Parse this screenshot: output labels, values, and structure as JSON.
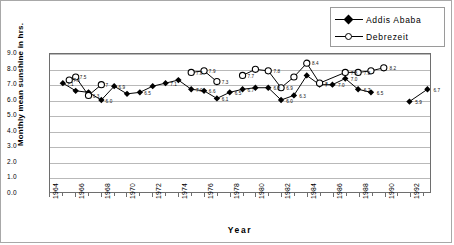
{
  "chart_data": {
    "type": "line",
    "title": "",
    "xlabel": "Year",
    "ylabel": "Monthly mean sunshine in hrs.",
    "xlim": [
      1964,
      1993.6
    ],
    "ylim": [
      0.0,
      9.0
    ],
    "ytick_step": 1.0,
    "grid": true,
    "legend_position": "top-right",
    "ytick_labels": [
      "9.0",
      "8.0",
      "7.0",
      "6.0",
      "5.0",
      "4.0",
      "3.0",
      "2.0",
      "1.0",
      "0.0"
    ],
    "ytick_values": [
      9.0,
      8.0,
      7.0,
      6.0,
      5.0,
      4.0,
      3.0,
      2.0,
      1.0,
      0.0
    ],
    "xtick_labels": [
      "1964",
      "1966",
      "1968",
      "1970",
      "1972",
      "1974",
      "1976",
      "1978",
      "1980",
      "1982",
      "1984",
      "1986",
      "1988",
      "1990",
      "1992"
    ],
    "xtick_values": [
      1964,
      1966,
      1968,
      1970,
      1972,
      1974,
      1976,
      1978,
      1980,
      1982,
      1984,
      1986,
      1988,
      1990,
      1992
    ],
    "series": [
      {
        "name": "Addis Ababa",
        "marker": "filled-diamond",
        "color": "#000000",
        "x": [
          1965,
          1966,
          1967,
          1968,
          1969,
          1970,
          1971,
          1972,
          1973,
          1974,
          1975,
          1976,
          1977,
          1978,
          1979,
          1980,
          1981,
          1982,
          1983,
          1984,
          1985,
          1986,
          1987,
          1988,
          1989
        ],
        "values": [
          7.1,
          6.6,
          6.5,
          6.0,
          6.9,
          6.4,
          6.5,
          6.9,
          7.1,
          7.3,
          6.7,
          6.6,
          6.1,
          6.5,
          6.7,
          6.8,
          6.8,
          6.0,
          6.3,
          7.6,
          7.0,
          7.0,
          7.4,
          6.7,
          6.5
        ],
        "labels": [
          "7.1",
          "",
          "",
          "6.0",
          "6.9",
          "",
          "6.5",
          "",
          "7.1",
          "",
          "7.0",
          "6.6",
          "6.1",
          "6.5",
          "6.7",
          "",
          "6.8",
          "6.0",
          "6.3",
          "",
          "7",
          "7.0",
          "7.0",
          "6.7",
          "6.5"
        ],
        "segments_gap_after": [
          1989
        ]
      },
      {
        "name": "Addis Ababa (isolated)",
        "marker": "filled-diamond",
        "color": "#000000",
        "x": [
          1992,
          1993.4
        ],
        "values": [
          5.9,
          6.7
        ],
        "labels": [
          "5.9",
          "6.7"
        ]
      },
      {
        "name": "Debrezeit",
        "marker": "open-circle",
        "color": "#000000",
        "segments": [
          {
            "x": [
              1965.5,
              1966,
              1967,
              1968
            ],
            "values": [
              7.3,
              7.5,
              6.3,
              7.0
            ],
            "labels": [
              "7.3",
              "7.5",
              "6.3",
              "7"
            ]
          },
          {
            "x": [
              1975,
              1976,
              1977
            ],
            "values": [
              7.8,
              7.9,
              7.2
            ],
            "labels": [
              "7.8",
              "7.9",
              "7.3"
            ]
          },
          {
            "x": [
              1979,
              1980,
              1981,
              1982,
              1983,
              1984,
              1985,
              1987,
              1988,
              1989,
              1990
            ],
            "values": [
              7.6,
              8.0,
              7.9,
              6.8,
              7.5,
              8.4,
              7.1,
              7.8,
              7.8,
              7.9,
              8.1
            ],
            "labels": [
              "7.7",
              "",
              "7.8",
              "6.9",
              "",
              "8.4",
              "7",
              "7.8",
              "7.8",
              "",
              "8.2"
            ]
          }
        ]
      }
    ]
  },
  "legend": {
    "items": [
      {
        "label": "Addis Ababa",
        "marker": "filled-diamond"
      },
      {
        "label": "Debrezeit",
        "marker": "open-circle"
      }
    ]
  },
  "axes": {
    "x_title": "Year",
    "y_title": "Monthly mean sunshine in hrs."
  }
}
